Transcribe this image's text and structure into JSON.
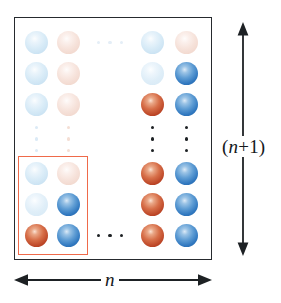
{
  "figure": {
    "colors": {
      "border": "#262a2e",
      "highlight": "#ef6a4a",
      "blue_solid": "#2f77bf",
      "red_solid": "#bc4526",
      "blue_faint": "#d8ebf7",
      "pink_faint": "#f6e2da",
      "arrow": "#1d2124",
      "background": "#ffffff"
    },
    "annotations": {
      "vertical_label": "(n+1)",
      "vertical_label_italic_part": "n",
      "vertical_label_prefix": "(",
      "vertical_label_suffix": "+1)",
      "horizontal_label": "n"
    },
    "grid": {
      "columns_shown": 4,
      "rows_shown": 6,
      "column_ellipsis": true,
      "row_ellipsis": true
    },
    "spheres": [
      {
        "name": "sphere-c1-r1",
        "col": 1,
        "row": 1,
        "state": "blue-faint",
        "x": 25,
        "y": 31
      },
      {
        "name": "sphere-c2-r1",
        "col": 2,
        "row": 1,
        "state": "pink-faint",
        "x": 57,
        "y": 31
      },
      {
        "name": "sphere-c3-r1",
        "col": 3,
        "row": 1,
        "state": "blue-faint",
        "x": 141,
        "y": 31
      },
      {
        "name": "sphere-c4-r1",
        "col": 4,
        "row": 1,
        "state": "pink-faint",
        "x": 175,
        "y": 31
      },
      {
        "name": "sphere-c1-r2",
        "col": 1,
        "row": 2,
        "state": "blue-faint",
        "x": 25,
        "y": 62
      },
      {
        "name": "sphere-c2-r2",
        "col": 2,
        "row": 2,
        "state": "pink-faint",
        "x": 57,
        "y": 62
      },
      {
        "name": "sphere-c3-r2",
        "col": 3,
        "row": 2,
        "state": "blue-faint2",
        "x": 141,
        "y": 62
      },
      {
        "name": "sphere-c4-r2",
        "col": 4,
        "row": 2,
        "state": "blue-solid",
        "x": 175,
        "y": 62
      },
      {
        "name": "sphere-c1-r3",
        "col": 1,
        "row": 3,
        "state": "blue-faint",
        "x": 25,
        "y": 93
      },
      {
        "name": "sphere-c2-r3",
        "col": 2,
        "row": 3,
        "state": "pink-faint",
        "x": 57,
        "y": 93
      },
      {
        "name": "sphere-c3-r3",
        "col": 3,
        "row": 3,
        "state": "red-solid",
        "x": 141,
        "y": 93
      },
      {
        "name": "sphere-c4-r3",
        "col": 4,
        "row": 3,
        "state": "blue-solid",
        "x": 175,
        "y": 93
      },
      {
        "name": "sphere-c1-r4",
        "col": 1,
        "row": 4,
        "state": "blue-faint",
        "x": 25,
        "y": 162
      },
      {
        "name": "sphere-c2-r4",
        "col": 2,
        "row": 4,
        "state": "pink-faint",
        "x": 57,
        "y": 162
      },
      {
        "name": "sphere-c3-r4",
        "col": 3,
        "row": 4,
        "state": "red-solid",
        "x": 141,
        "y": 162
      },
      {
        "name": "sphere-c4-r4",
        "col": 4,
        "row": 4,
        "state": "blue-solid",
        "x": 175,
        "y": 162
      },
      {
        "name": "sphere-c1-r5",
        "col": 1,
        "row": 5,
        "state": "blue-faint2",
        "x": 25,
        "y": 193
      },
      {
        "name": "sphere-c2-r5",
        "col": 2,
        "row": 5,
        "state": "blue-solid",
        "x": 57,
        "y": 193
      },
      {
        "name": "sphere-c3-r5",
        "col": 3,
        "row": 5,
        "state": "red-solid",
        "x": 141,
        "y": 193
      },
      {
        "name": "sphere-c4-r5",
        "col": 4,
        "row": 5,
        "state": "blue-solid",
        "x": 175,
        "y": 193
      },
      {
        "name": "sphere-c1-r6",
        "col": 1,
        "row": 6,
        "state": "red-solid",
        "x": 25,
        "y": 224
      },
      {
        "name": "sphere-c2-r6",
        "col": 2,
        "row": 6,
        "state": "blue-solid",
        "x": 57,
        "y": 224
      },
      {
        "name": "sphere-c3-r6",
        "col": 3,
        "row": 6,
        "state": "red-solid",
        "x": 141,
        "y": 224
      },
      {
        "name": "sphere-c4-r6",
        "col": 4,
        "row": 6,
        "state": "blue-solid",
        "x": 175,
        "y": 224
      }
    ],
    "ellipses": [
      {
        "name": "ellipsis-row1-horizontal",
        "orientation": "horizontal",
        "tone": "pale-mix",
        "x": 97,
        "y": 40
      },
      {
        "name": "ellipsis-row6-horizontal",
        "orientation": "horizontal",
        "tone": "dark",
        "x": 97,
        "y": 233
      },
      {
        "name": "ellipsis-col1-vertical",
        "orientation": "vertical",
        "tone": "pale-blue",
        "x": 34,
        "y": 126
      },
      {
        "name": "ellipsis-col2-vertical",
        "orientation": "vertical",
        "tone": "pale-pink",
        "x": 66,
        "y": 126
      },
      {
        "name": "ellipsis-col3-vertical",
        "orientation": "vertical",
        "tone": "dark",
        "x": 150,
        "y": 126
      },
      {
        "name": "ellipsis-col4-vertical",
        "orientation": "vertical",
        "tone": "dark",
        "x": 184,
        "y": 126
      }
    ]
  }
}
